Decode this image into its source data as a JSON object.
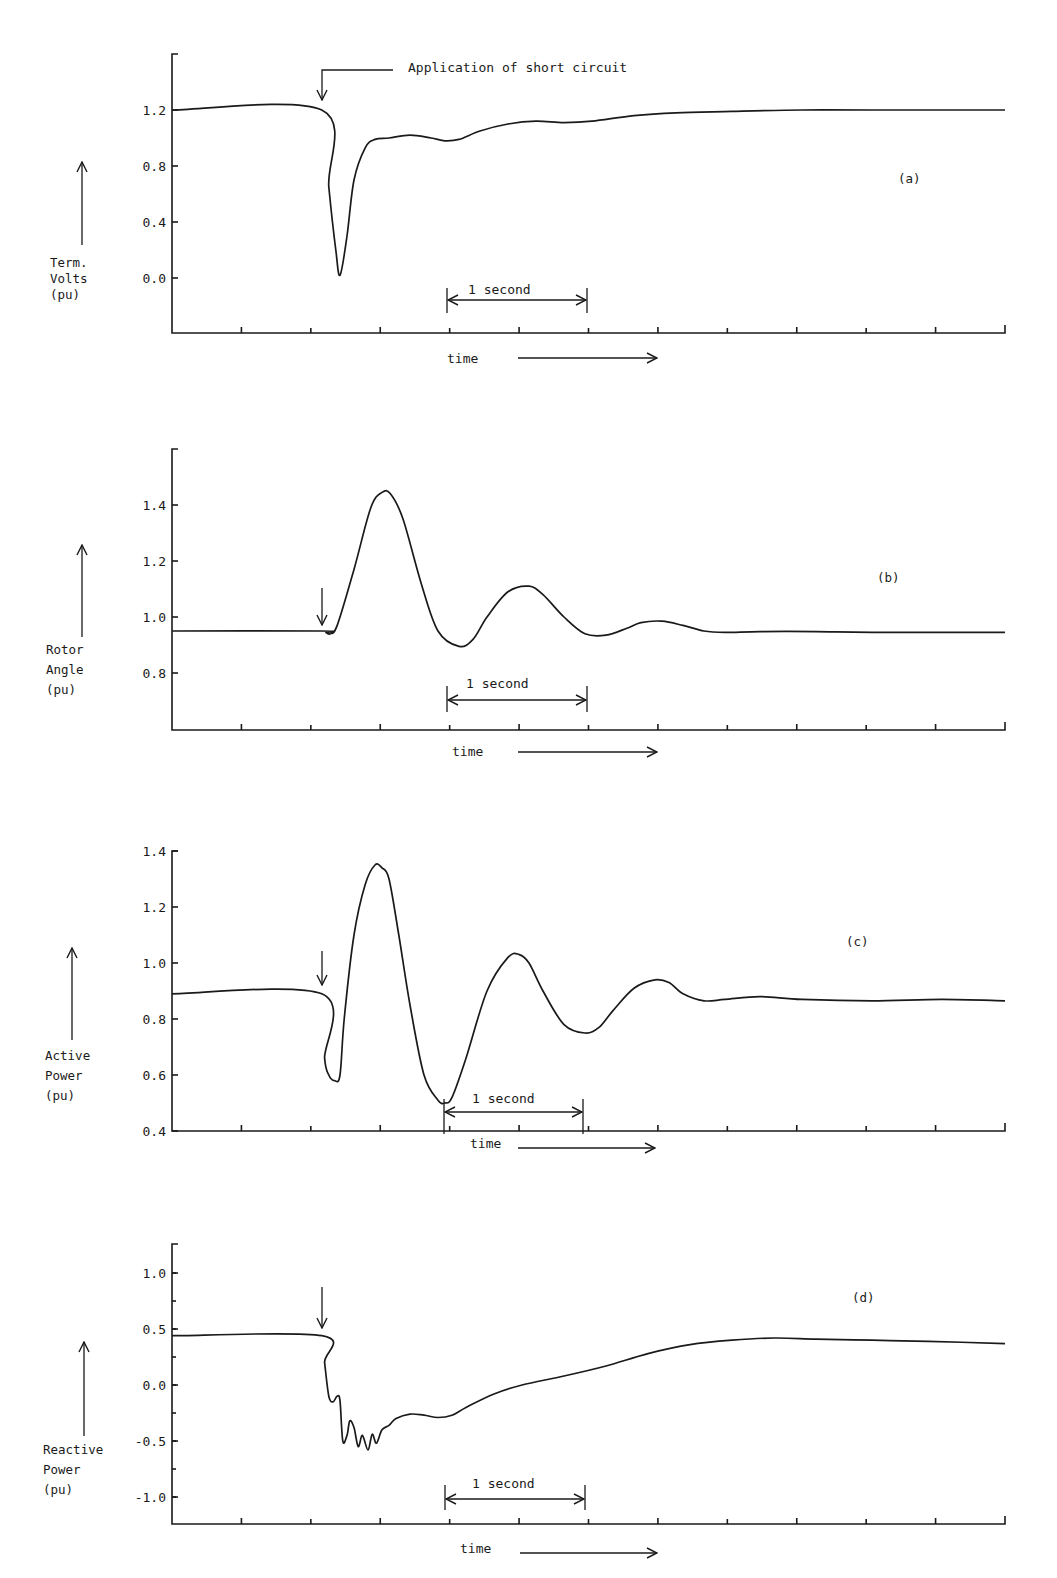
{
  "figure": {
    "time_label": "time",
    "scale_bar_label": "1 second",
    "annotation": "Application of short circuit"
  },
  "chart_data": [
    {
      "id": "a",
      "type": "line",
      "panel_label": "(a)",
      "title": "",
      "ylabel_lines": [
        "Term.",
        "Volts",
        "(pu)"
      ],
      "xlabel": "time",
      "yticks": [
        1.2,
        0.8,
        0.4,
        0.0
      ],
      "ytick_labels": [
        "1.2",
        "0.8",
        "0.4",
        "0.0"
      ],
      "ylim": [
        -0.39,
        1.6
      ],
      "xlim_s": [
        0,
        5.95
      ],
      "grid": false,
      "fault_time_s": 1.07,
      "annotation": "Application of short circuit",
      "series": [
        {
          "name": "Terminal Voltage",
          "t": [
            0,
            1.07,
            1.12,
            1.17,
            1.2,
            1.25,
            1.3,
            1.38,
            1.45,
            1.55,
            1.7,
            1.85,
            1.95,
            2.05,
            2.2,
            2.4,
            2.6,
            2.8,
            3.0,
            3.3,
            3.6,
            4.0,
            4.5,
            5.0,
            5.95
          ],
          "v": [
            1.2,
            1.2,
            0.65,
            0.2,
            0.02,
            0.3,
            0.7,
            0.93,
            0.99,
            1.0,
            1.02,
            1.0,
            0.98,
            0.99,
            1.05,
            1.1,
            1.12,
            1.11,
            1.12,
            1.16,
            1.18,
            1.19,
            1.2,
            1.2,
            1.2
          ]
        }
      ]
    },
    {
      "id": "b",
      "type": "line",
      "panel_label": "(b)",
      "title": "",
      "ylabel_lines": [
        "Rotor",
        "Angle",
        "(pu)"
      ],
      "xlabel": "time",
      "yticks": [
        1.4,
        1.2,
        1.0,
        0.8
      ],
      "ytick_labels": [
        "1.4",
        "1.2",
        "1.0",
        "0.8"
      ],
      "ylim": [
        0.6,
        1.6
      ],
      "xlim_s": [
        0,
        5.95
      ],
      "grid": false,
      "fault_time_s": 1.07,
      "series": [
        {
          "name": "Rotor Angle",
          "t": [
            0,
            1.07,
            1.1,
            1.13,
            1.18,
            1.3,
            1.42,
            1.5,
            1.56,
            1.65,
            1.78,
            1.9,
            2.05,
            2.15,
            2.25,
            2.4,
            2.55,
            2.65,
            2.8,
            2.95,
            3.1,
            3.25,
            3.35,
            3.5,
            3.65,
            3.8,
            3.95,
            4.2,
            4.6,
            5.0,
            5.95
          ],
          "v": [
            0.95,
            0.95,
            0.945,
            0.94,
            0.97,
            1.17,
            1.39,
            1.445,
            1.44,
            1.35,
            1.12,
            0.95,
            0.895,
            0.92,
            1.0,
            1.09,
            1.11,
            1.08,
            1.0,
            0.94,
            0.935,
            0.96,
            0.98,
            0.985,
            0.97,
            0.95,
            0.945,
            0.948,
            0.948,
            0.945,
            0.945
          ]
        }
      ]
    },
    {
      "id": "c",
      "type": "line",
      "panel_label": "(c)",
      "title": "",
      "ylabel_lines": [
        "Active",
        "Power",
        "(pu)"
      ],
      "xlabel": "time",
      "yticks": [
        1.4,
        1.2,
        1.0,
        0.8,
        0.6,
        0.4
      ],
      "ytick_labels": [
        "1.4",
        "1.2",
        "1.0",
        "0.8",
        "0.6",
        "0.4"
      ],
      "ylim": [
        0.4,
        1.4
      ],
      "xlim_s": [
        0,
        5.95
      ],
      "grid": false,
      "fault_time_s": 1.07,
      "series": [
        {
          "name": "Active Power",
          "t": [
            0,
            1.07,
            1.09,
            1.12,
            1.16,
            1.2,
            1.23,
            1.3,
            1.38,
            1.45,
            1.5,
            1.55,
            1.62,
            1.7,
            1.8,
            1.9,
            1.95,
            2.0,
            2.1,
            2.25,
            2.4,
            2.48,
            2.55,
            2.65,
            2.8,
            2.95,
            3.05,
            3.15,
            3.3,
            3.45,
            3.55,
            3.65,
            3.8,
            3.95,
            4.2,
            4.5,
            5.0,
            5.5,
            5.95
          ],
          "v": [
            0.89,
            0.89,
            0.66,
            0.6,
            0.58,
            0.6,
            0.8,
            1.1,
            1.28,
            1.35,
            1.34,
            1.3,
            1.1,
            0.85,
            0.6,
            0.51,
            0.5,
            0.52,
            0.66,
            0.9,
            1.02,
            1.03,
            1.0,
            0.9,
            0.78,
            0.75,
            0.77,
            0.83,
            0.91,
            0.94,
            0.93,
            0.89,
            0.865,
            0.87,
            0.88,
            0.87,
            0.865,
            0.87,
            0.865
          ]
        }
      ]
    },
    {
      "id": "d",
      "type": "line",
      "panel_label": "(d)",
      "title": "",
      "ylabel_lines": [
        "Reactive",
        "Power",
        "(pu)"
      ],
      "xlabel": "time",
      "yticks": [
        1.0,
        0.5,
        0.0,
        -0.5,
        -1.0
      ],
      "ytick_labels": [
        "1.0",
        "0.5",
        "0.0",
        "-0.5",
        "-1.0"
      ],
      "yminor_step": 0.25,
      "ylim": [
        -1.24,
        1.26
      ],
      "xlim_s": [
        0,
        5.95
      ],
      "grid": false,
      "fault_time_s": 1.07,
      "series": [
        {
          "name": "Reactive Power",
          "t": [
            0,
            1.07,
            1.09,
            1.12,
            1.15,
            1.18,
            1.2,
            1.22,
            1.25,
            1.27,
            1.3,
            1.33,
            1.36,
            1.4,
            1.43,
            1.46,
            1.5,
            1.55,
            1.6,
            1.7,
            1.8,
            1.9,
            2.0,
            2.1,
            2.3,
            2.5,
            2.8,
            3.1,
            3.4,
            3.7,
            4.0,
            4.3,
            4.6,
            5.0,
            5.4,
            5.95
          ],
          "v": [
            0.44,
            0.44,
            0.2,
            -0.1,
            -0.15,
            -0.1,
            -0.14,
            -0.5,
            -0.45,
            -0.32,
            -0.38,
            -0.55,
            -0.45,
            -0.58,
            -0.44,
            -0.52,
            -0.4,
            -0.36,
            -0.3,
            -0.26,
            -0.27,
            -0.29,
            -0.27,
            -0.2,
            -0.08,
            0.0,
            0.08,
            0.17,
            0.28,
            0.36,
            0.4,
            0.42,
            0.41,
            0.4,
            0.39,
            0.37
          ]
        }
      ]
    }
  ]
}
